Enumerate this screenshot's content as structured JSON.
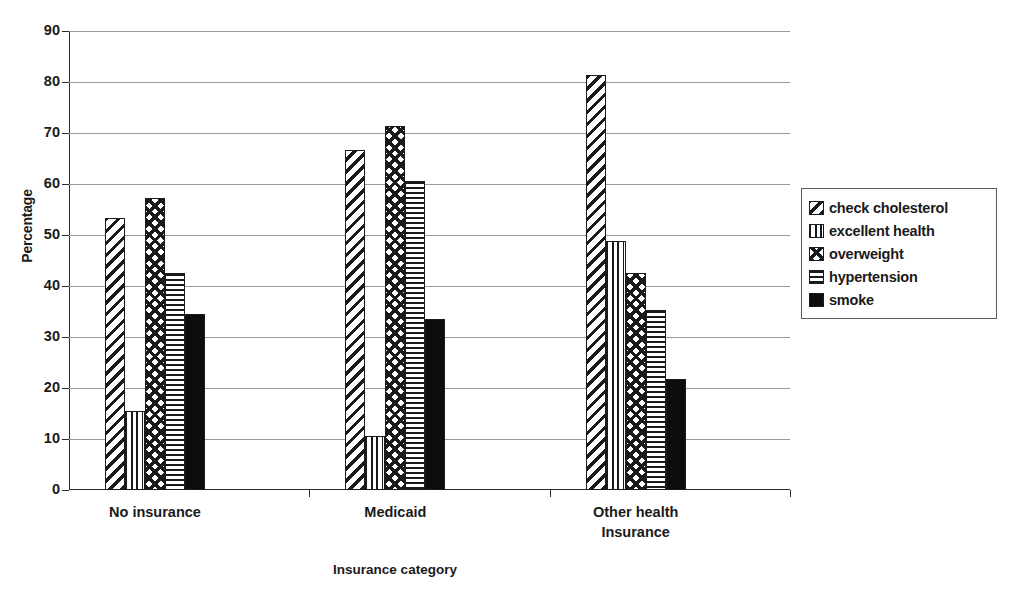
{
  "chart_data": {
    "type": "bar",
    "title": "",
    "xlabel": "Insurance category",
    "ylabel": "Percentage",
    "ylim": [
      0,
      90
    ],
    "yticks": [
      0,
      10,
      20,
      30,
      40,
      50,
      60,
      70,
      80,
      90
    ],
    "grid": true,
    "legend_position": "right",
    "categories": [
      "No insurance",
      "Medicaid",
      "Other health Insurance"
    ],
    "category_lines": [
      [
        "No insurance"
      ],
      [
        "Medicaid"
      ],
      [
        "Other health",
        "Insurance"
      ]
    ],
    "series": [
      {
        "name": "check cholesterol",
        "pattern": "diagonal-stripes",
        "values": [
          53.3,
          66.7,
          81.3
        ]
      },
      {
        "name": "excellent health",
        "pattern": "vertical-lines",
        "values": [
          15.5,
          10.6,
          48.9
        ]
      },
      {
        "name": "overweight",
        "pattern": "diamond-checker",
        "values": [
          57.3,
          71.3,
          42.6
        ]
      },
      {
        "name": "hypertension",
        "pattern": "horizontal-lines",
        "values": [
          42.5,
          60.5,
          35.2
        ]
      },
      {
        "name": "smoke",
        "pattern": "solid-black",
        "values": [
          34.5,
          33.6,
          21.8
        ]
      }
    ]
  },
  "axis": {
    "y_title": "Percentage",
    "x_title": "Insurance category",
    "y_tick_labels": [
      "90",
      "80",
      "70",
      "60",
      "50",
      "40",
      "30",
      "20",
      "10",
      "0"
    ]
  },
  "legend": {
    "items": [
      {
        "label": "check cholesterol",
        "pattern": "diagonal-stripes"
      },
      {
        "label": "excellent health",
        "pattern": "vertical-lines"
      },
      {
        "label": "overweight",
        "pattern": "diamond-checker"
      },
      {
        "label": "hypertension",
        "pattern": "horizontal-lines"
      },
      {
        "label": "smoke",
        "pattern": "solid-black"
      }
    ]
  },
  "colors": {
    "ink": "#1a1a1a",
    "gridline": "#9a9a9a",
    "axis": "#2b2b2b",
    "background": "#ffffff"
  }
}
